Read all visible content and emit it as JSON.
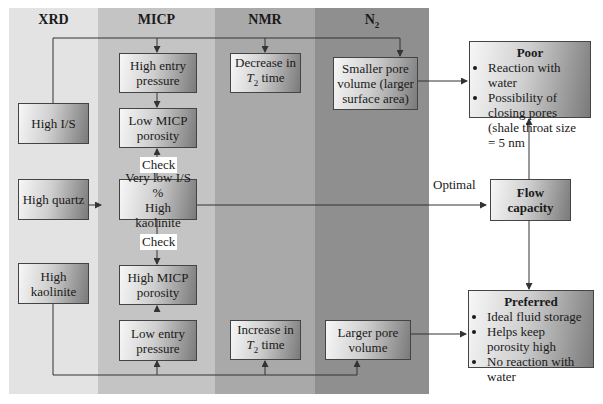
{
  "columns": {
    "xrd": "XRD",
    "micp": "MICP",
    "nmr": "NMR",
    "n2": "N",
    "n2_sub": "2"
  },
  "boxes": {
    "high_is": "High I/S",
    "high_quartz": "High quartz",
    "high_kaolinite_xrd": "High kaolinite",
    "high_entry_pressure": "High entry pressure",
    "low_micp_porosity": "Low MICP porosity",
    "very_low_is_1": "Very low I/S %",
    "very_low_is_2": "High kaolinite",
    "high_micp_porosity": "High MICP porosity",
    "low_entry_pressure": "Low entry pressure",
    "decrease_t2_pre": "Decrease in",
    "decrease_t2_t": "T",
    "decrease_t2_sub": "2",
    "decrease_t2_post": " time",
    "increase_t2_pre": "Increase in",
    "increase_t2_t": "T",
    "increase_t2_sub": "2",
    "increase_t2_post": " time",
    "smaller_pore": "Smaller pore volume (larger surface area)",
    "larger_pore": "Larger pore volume",
    "flow_capacity": "Flow capacity"
  },
  "poor": {
    "title": "Poor",
    "items": [
      "Reaction with water",
      "Possibility of closing pores (shale throat size = 5 nm"
    ]
  },
  "preferred": {
    "title": "Preferred",
    "items": [
      "Ideal fluid storage",
      "Helps keep porosity high",
      "No reaction with water"
    ]
  },
  "labels": {
    "check_top": "Check",
    "check_bottom": "Check",
    "optimal": "Optimal"
  }
}
